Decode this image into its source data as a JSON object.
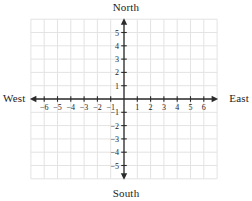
{
  "figure": {
    "title_labels": {
      "north": "North",
      "south": "South",
      "west": "West",
      "east": "East"
    },
    "background_color": "#ffffff",
    "grid_color": "#e3e3e3",
    "axis_color": "#2b2b2b",
    "text_color": "#1c1c1c"
  },
  "chart_data": {
    "type": "scatter",
    "title": "",
    "subtitle": "",
    "xlabel": "",
    "ylabel": "",
    "xlim": [
      -7,
      7
    ],
    "ylim": [
      -6,
      6
    ],
    "grid": true,
    "legend": null,
    "series": [
      {
        "name": "",
        "x": [],
        "y": []
      }
    ],
    "x_ticks": [
      -6,
      -5,
      -4,
      -3,
      -2,
      -1,
      1,
      2,
      3,
      4,
      5,
      6
    ],
    "x_tick_labels": [
      "−6",
      "−5",
      "−4",
      "−3",
      "−2",
      "−1",
      "1",
      "2",
      "3",
      "4",
      "5",
      "6"
    ],
    "y_ticks": [
      5,
      4,
      3,
      2,
      1,
      -1,
      -2,
      -3,
      -4,
      -5
    ],
    "y_tick_labels": [
      "5",
      "4",
      "3",
      "2",
      "1",
      "−1",
      "−2",
      "−3",
      "−4",
      "−5"
    ],
    "annotations": [
      "North",
      "South",
      "West",
      "East"
    ],
    "axis_arrows": [
      "left",
      "right",
      "up",
      "down"
    ],
    "origin_label": ""
  }
}
